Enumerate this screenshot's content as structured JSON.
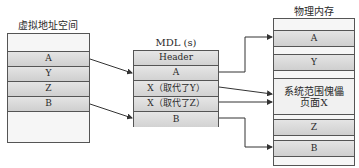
{
  "virtual": {
    "title": "虚拟地址空间",
    "rows": [
      "A",
      "Y",
      "Z",
      "B"
    ]
  },
  "mdl": {
    "title": "MDL (s)",
    "rows": [
      "Header",
      "A",
      "X（取代了Y）",
      "X（取代了Z）",
      "B"
    ]
  },
  "physical": {
    "title": "物理内存",
    "rows": [
      "A",
      "Y",
      "系统范围傀儡\n页面X",
      "Z",
      "B"
    ],
    "big_line1": "系统范围傀儡",
    "big_line2": "页面X"
  },
  "colors": {
    "border": "#555555",
    "fill": "#d6d6d6",
    "arrow": "#333333"
  }
}
